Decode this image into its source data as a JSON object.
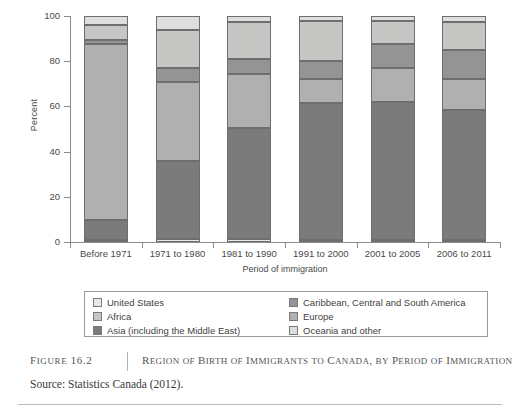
{
  "chart_data": {
    "type": "bar",
    "subtype": "stacked-100-percent",
    "title": "Region of Birth of Immigrants to Canada, by Period of Immigration",
    "xlabel": "Period of immigration",
    "ylabel": "Percent",
    "ylim": [
      0,
      100
    ],
    "yticks": [
      0,
      20,
      40,
      60,
      80,
      100
    ],
    "grid": false,
    "legend_position": "bottom",
    "categories": [
      "Before 1971",
      "1971 to 1980",
      "1981 to 1990",
      "1991 to 2000",
      "2001 to 2005",
      "2006 to 2011"
    ],
    "series": [
      {
        "name": "United States",
        "color": "#e8e8e6",
        "values": [
          1.0,
          1.5,
          1.2,
          0.9,
          0.8,
          0.8
        ]
      },
      {
        "name": "Asia (including the Middle East)",
        "color": "#7b7b7b",
        "values": [
          8.7,
          34.3,
          49.3,
          60.7,
          61.0,
          57.7
        ]
      },
      {
        "name": "Europe",
        "color": "#b0b0b0",
        "values": [
          78.0,
          35.0,
          24.0,
          10.4,
          15.2,
          13.5
        ]
      },
      {
        "name": "Caribbean, Central and South America",
        "color": "#949494",
        "values": [
          1.5,
          6.0,
          6.5,
          8.0,
          10.5,
          12.8
        ]
      },
      {
        "name": "Africa",
        "color": "#c6c6c4",
        "values": [
          6.8,
          17.2,
          16.5,
          18.0,
          10.5,
          12.7
        ]
      },
      {
        "name": "Oceania and other",
        "color": "#dedede",
        "values": [
          4.0,
          6.0,
          2.5,
          2.0,
          2.0,
          2.5
        ]
      }
    ]
  },
  "legend": {
    "items": [
      {
        "label": "United States",
        "color": "#e8e8e6"
      },
      {
        "label": "Caribbean, Central and South America",
        "color": "#949494"
      },
      {
        "label": "Africa",
        "color": "#c6c6c4"
      },
      {
        "label": "Europe",
        "color": "#b0b0b0"
      },
      {
        "label": "Asia (including the Middle East)",
        "color": "#7b7b7b"
      },
      {
        "label": "Oceania and other",
        "color": "#dedede"
      }
    ]
  },
  "caption": {
    "figure_number": "Figure 16.2",
    "title": "Region of Birth of Immigrants to Canada, by Period of Immigration",
    "source": "Source: Statistics Canada (2012)."
  }
}
